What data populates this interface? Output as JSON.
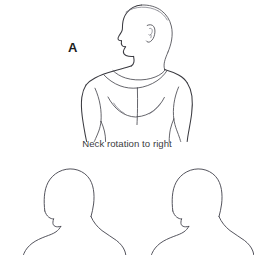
{
  "figure": {
    "domain": "anatomical-illustration",
    "background_color": "#ffffff",
    "line_color": "#3a3a40",
    "panel_label": "A",
    "caption": "Neck rotation to right",
    "caption_color": "#3c3c42",
    "width": 254,
    "height": 255
  },
  "panels": [
    {
      "id": "panel-a",
      "label": "A",
      "caption": "Neck rotation to right",
      "subject": "male-torso-head-rotated-right",
      "view": "anterior-with-head-turned",
      "details": [
        "head-profile",
        "ear",
        "neck",
        "clavicles",
        "shoulders",
        "pectorals",
        "arms"
      ]
    },
    {
      "id": "panel-bottom-left",
      "label": "",
      "caption": "",
      "subject": "head-and-shoulders-outline",
      "view": "posterior-oblique",
      "details": [
        "head-outline",
        "neck",
        "shoulders"
      ]
    },
    {
      "id": "panel-bottom-right",
      "label": "",
      "caption": "",
      "subject": "head-and-shoulders-outline",
      "view": "posterior-oblique",
      "details": [
        "head-outline",
        "neck",
        "shoulders"
      ]
    }
  ]
}
